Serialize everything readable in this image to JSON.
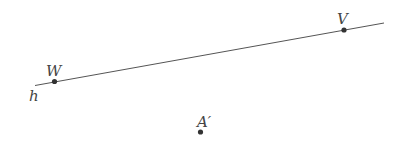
{
  "diagram": {
    "line": {
      "name": "h",
      "x1": 35,
      "y1": 85.5,
      "x2": 384,
      "y2": 23,
      "color": "#555555",
      "label_x": 29,
      "label_y": 101
    },
    "points": [
      {
        "id": "W",
        "label": "W",
        "x": 54.5,
        "y": 81.5,
        "label_x": 46,
        "label_y": 76
      },
      {
        "id": "V",
        "label": "V",
        "x": 344,
        "y": 30,
        "label_x": 337,
        "label_y": 24
      },
      {
        "id": "A-prime",
        "label": "A′",
        "x": 200.5,
        "y": 132,
        "label_x": 197,
        "label_y": 127
      }
    ],
    "point_color": "#333333",
    "label_color": "#444444"
  }
}
